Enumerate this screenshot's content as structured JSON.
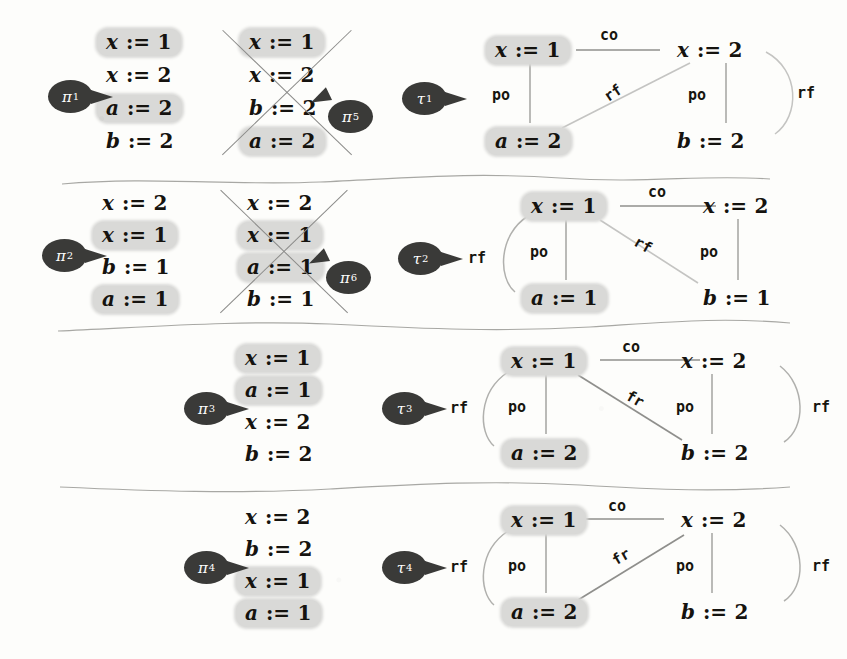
{
  "figure": {
    "highlight_color": "#d9d9d7",
    "badge_color": "#3a3a38",
    "ink_color": "#15130f",
    "edge_color": "#9a9a98",
    "strike_color": "#8b8b89"
  },
  "rows": [
    {
      "id": "row-1",
      "traces": [
        {
          "label": "π",
          "sub": "1",
          "crossed": false,
          "steps": [
            {
              "var": "x",
              "op": ":=",
              "val": "1",
              "highlight": true
            },
            {
              "var": "x",
              "op": ":=",
              "val": "2",
              "highlight": false
            },
            {
              "var": "a",
              "op": ":=",
              "val": "2",
              "highlight": true
            },
            {
              "var": "b",
              "op": ":=",
              "val": "2",
              "highlight": false
            }
          ]
        },
        {
          "label": "π",
          "sub": "5",
          "crossed": true,
          "steps": [
            {
              "var": "x",
              "op": ":=",
              "val": "1",
              "highlight": true
            },
            {
              "var": "x",
              "op": ":=",
              "val": "2",
              "highlight": false
            },
            {
              "var": "b",
              "op": ":=",
              "val": "2",
              "highlight": false
            },
            {
              "var": "a",
              "op": ":=",
              "val": "2",
              "highlight": true
            }
          ]
        }
      ],
      "graph": {
        "label": "τ",
        "sub": "1",
        "outer_label": "",
        "nodes": {
          "tl": {
            "var": "x",
            "op": ":=",
            "val": "1",
            "highlight": true
          },
          "tr": {
            "var": "x",
            "op": ":=",
            "val": "2",
            "highlight": false
          },
          "bl": {
            "var": "a",
            "op": ":=",
            "val": "2",
            "highlight": true
          },
          "br": {
            "var": "b",
            "op": ":=",
            "val": "2",
            "highlight": false
          }
        },
        "edges": [
          {
            "name": "co",
            "label": "co",
            "dir": "lr"
          },
          {
            "name": "po-left",
            "label": "po"
          },
          {
            "name": "po-right",
            "label": "po"
          },
          {
            "name": "rf-diag",
            "label": "rf",
            "from": "tr",
            "to": "bl"
          },
          {
            "name": "rf-arc",
            "label": "rf",
            "side": "right",
            "from": "tr",
            "to": "br"
          }
        ]
      }
    },
    {
      "id": "row-2",
      "traces": [
        {
          "label": "π",
          "sub": "2",
          "crossed": false,
          "steps": [
            {
              "var": "x",
              "op": ":=",
              "val": "2",
              "highlight": false
            },
            {
              "var": "x",
              "op": ":=",
              "val": "1",
              "highlight": true
            },
            {
              "var": "b",
              "op": ":=",
              "val": "1",
              "highlight": false
            },
            {
              "var": "a",
              "op": ":=",
              "val": "1",
              "highlight": true
            }
          ]
        },
        {
          "label": "π",
          "sub": "6",
          "crossed": true,
          "steps": [
            {
              "var": "x",
              "op": ":=",
              "val": "2",
              "highlight": false
            },
            {
              "var": "x",
              "op": ":=",
              "val": "1",
              "highlight": true
            },
            {
              "var": "a",
              "op": ":=",
              "val": "1",
              "highlight": true
            },
            {
              "var": "b",
              "op": ":=",
              "val": "1",
              "highlight": false
            }
          ]
        }
      ],
      "graph": {
        "label": "τ",
        "sub": "2",
        "outer_label": "rf",
        "nodes": {
          "tl": {
            "var": "x",
            "op": ":=",
            "val": "1",
            "highlight": true
          },
          "tr": {
            "var": "x",
            "op": ":=",
            "val": "2",
            "highlight": false
          },
          "bl": {
            "var": "a",
            "op": ":=",
            "val": "1",
            "highlight": true
          },
          "br": {
            "var": "b",
            "op": ":=",
            "val": "1",
            "highlight": false
          }
        },
        "edges": [
          {
            "name": "co",
            "label": "co",
            "dir": "rl"
          },
          {
            "name": "rf-arc-left",
            "label": "rf",
            "side": "left",
            "from": "tl",
            "to": "bl"
          },
          {
            "name": "po-left",
            "label": "po"
          },
          {
            "name": "po-right",
            "label": "po"
          },
          {
            "name": "rf-diag",
            "label": "rf",
            "from": "tl",
            "to": "br"
          }
        ]
      }
    },
    {
      "id": "row-3",
      "traces": [
        {
          "label": "π",
          "sub": "3",
          "crossed": false,
          "steps": [
            {
              "var": "x",
              "op": ":=",
              "val": "1",
              "highlight": true
            },
            {
              "var": "a",
              "op": ":=",
              "val": "1",
              "highlight": true
            },
            {
              "var": "x",
              "op": ":=",
              "val": "2",
              "highlight": false
            },
            {
              "var": "b",
              "op": ":=",
              "val": "2",
              "highlight": false
            }
          ]
        }
      ],
      "graph": {
        "label": "τ",
        "sub": "3",
        "outer_label": "rf",
        "nodes": {
          "tl": {
            "var": "x",
            "op": ":=",
            "val": "1",
            "highlight": true
          },
          "tr": {
            "var": "x",
            "op": ":=",
            "val": "2",
            "highlight": false
          },
          "bl": {
            "var": "a",
            "op": ":=",
            "val": "2",
            "highlight": true
          },
          "br": {
            "var": "b",
            "op": ":=",
            "val": "2",
            "highlight": false
          }
        },
        "edges": [
          {
            "name": "co",
            "label": "co",
            "dir": "rl"
          },
          {
            "name": "rf-arc-left",
            "label": "rf",
            "side": "left",
            "from": "tl",
            "to": "bl"
          },
          {
            "name": "po-left",
            "label": "po"
          },
          {
            "name": "po-right",
            "label": "po"
          },
          {
            "name": "fr-diag",
            "label": "fr",
            "from": "br",
            "to": "tl"
          },
          {
            "name": "rf-arc-right",
            "label": "rf",
            "side": "right",
            "from": "tr",
            "to": "br"
          }
        ]
      }
    },
    {
      "id": "row-4",
      "traces": [
        {
          "label": "π",
          "sub": "4",
          "crossed": false,
          "steps": [
            {
              "var": "x",
              "op": ":=",
              "val": "2",
              "highlight": false
            },
            {
              "var": "b",
              "op": ":=",
              "val": "2",
              "highlight": false
            },
            {
              "var": "x",
              "op": ":=",
              "val": "1",
              "highlight": true
            },
            {
              "var": "a",
              "op": ":=",
              "val": "1",
              "highlight": true
            }
          ]
        }
      ],
      "graph": {
        "label": "τ",
        "sub": "4",
        "outer_label": "rf",
        "nodes": {
          "tl": {
            "var": "x",
            "op": ":=",
            "val": "1",
            "highlight": true
          },
          "tr": {
            "var": "x",
            "op": ":=",
            "val": "2",
            "highlight": false
          },
          "bl": {
            "var": "a",
            "op": ":=",
            "val": "2",
            "highlight": true
          },
          "br": {
            "var": "b",
            "op": ":=",
            "val": "2",
            "highlight": false
          }
        },
        "edges": [
          {
            "name": "co",
            "label": "co",
            "dir": "lr"
          },
          {
            "name": "rf-arc-left",
            "label": "rf",
            "side": "left",
            "from": "tl",
            "to": "bl"
          },
          {
            "name": "po-left",
            "label": "po"
          },
          {
            "name": "po-right",
            "label": "po"
          },
          {
            "name": "fr-diag",
            "label": "fr",
            "from": "bl",
            "to": "tr"
          },
          {
            "name": "rf-arc-right",
            "label": "rf",
            "side": "right",
            "from": "tr",
            "to": "br"
          }
        ]
      }
    }
  ],
  "labels": {
    "co": "co",
    "po": "po",
    "rf": "rf",
    "fr": "fr"
  }
}
